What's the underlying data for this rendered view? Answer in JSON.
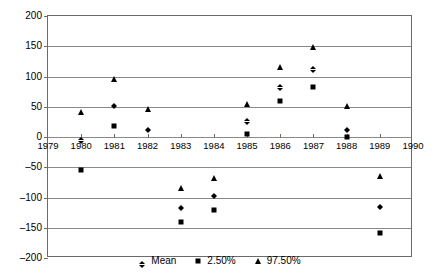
{
  "chart_data": {
    "type": "scatter",
    "title": "",
    "xlabel": "",
    "ylabel": "",
    "xlim": [
      1979,
      1990
    ],
    "ylim": [
      -200,
      200
    ],
    "grid": true,
    "legend_position": "bottom",
    "x_ticks": [
      "1979",
      "1980",
      "1981",
      "1982",
      "1983",
      "1984",
      "1985",
      "1986",
      "1987",
      "1988",
      "1989",
      "1990"
    ],
    "y_ticks": [
      "200",
      "150",
      "100",
      "50",
      "0",
      "-50",
      "-100",
      "-150",
      "-200"
    ],
    "x": [
      1980,
      1981,
      1982,
      1983,
      1984,
      1985,
      1986,
      1987,
      1988,
      1989
    ],
    "series": [
      {
        "name": "Mean",
        "marker": "diamond",
        "color": "#000000",
        "values": [
          0,
          57,
          17,
          -112,
          -92,
          31,
          87,
          117,
          17,
          -110
        ]
      },
      {
        "name": "2.50%",
        "marker": "square",
        "color": "#000000",
        "values": [
          -55,
          19,
          null,
          -140,
          -120,
          5,
          59,
          82,
          0,
          -158
        ]
      },
      {
        "name": "97.50%",
        "marker": "triangle",
        "color": "#000000",
        "values": [
          42,
          96,
          47,
          -85,
          -68,
          55,
          116,
          148,
          51,
          -65
        ]
      }
    ]
  },
  "legend": {
    "items": [
      {
        "label": "Mean",
        "marker": "diamond"
      },
      {
        "label": "2.50%",
        "marker": "square"
      },
      {
        "label": "97.50%",
        "marker": "triangle"
      }
    ]
  }
}
